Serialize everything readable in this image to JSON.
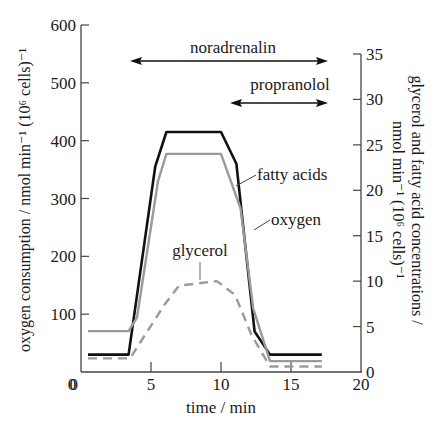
{
  "chart_data": {
    "type": "line",
    "title": "",
    "xlabel": "time / min",
    "ylabel_left": "oxygen consumption / nmol min⁻¹ (10⁶ cells)⁻¹",
    "ylabel_right_line1": "glycerol and fatty acid concentrations /",
    "ylabel_right_line2": "nmol min⁻¹ (10⁶ cells)⁻¹",
    "xlim": [
      0,
      20
    ],
    "ylim_left": [
      0,
      600
    ],
    "ylim_right": [
      0,
      35
    ],
    "x_ticks": [
      0,
      5,
      10,
      15,
      20
    ],
    "y_left_ticks": [
      0,
      100,
      200,
      300,
      400,
      500,
      600
    ],
    "y_right_ticks": [
      0,
      5,
      10,
      15,
      20,
      25,
      30,
      35
    ],
    "grid": false,
    "series": [
      {
        "name": "oxygen",
        "axis": "left",
        "color": "#111111",
        "style": "solid",
        "x": [
          0.5,
          3.4,
          5.3,
          6.1,
          10.0,
          11.1,
          12.4,
          13.5,
          17.2
        ],
        "values": [
          30,
          30,
          355,
          415,
          415,
          360,
          70,
          30,
          30
        ]
      },
      {
        "name": "fatty acids",
        "axis": "right",
        "color": "#9a9a9a",
        "style": "solid",
        "x": [
          0.5,
          3.4,
          4.0,
          5.5,
          6.1,
          10.0,
          11.4,
          12.3,
          13.5,
          17.2
        ],
        "values": [
          4.5,
          4.5,
          6,
          21,
          24,
          24,
          18,
          7,
          1.2,
          1.2
        ]
      },
      {
        "name": "glycerol",
        "axis": "right",
        "color": "#9a9a9a",
        "style": "dashed",
        "x": [
          0.5,
          3.5,
          6.0,
          7.0,
          9.7,
          11.0,
          12.2,
          13.5,
          17.2
        ],
        "values": [
          1.5,
          1.5,
          7.5,
          9.5,
          10,
          8.5,
          4,
          0.6,
          0.6
        ]
      }
    ],
    "annotations": [
      {
        "text": "noradrenalin",
        "type": "double-arrow",
        "x_start": 3.5,
        "x_end": 17.4
      },
      {
        "text": "propranolol",
        "type": "double-arrow",
        "x_start": 10.3,
        "x_end": 17.4
      },
      {
        "text": "fatty acids",
        "type": "label"
      },
      {
        "text": "oxygen",
        "type": "label"
      },
      {
        "text": "glycerol",
        "type": "label"
      }
    ]
  }
}
